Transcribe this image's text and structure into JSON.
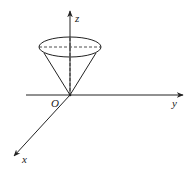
{
  "diagram": {
    "type": "3d-coordinate-cone",
    "labels": {
      "origin": "O",
      "x_axis": "x",
      "y_axis": "y",
      "z_axis": "z"
    },
    "colors": {
      "stroke": "#222222",
      "background": "#ffffff"
    }
  }
}
